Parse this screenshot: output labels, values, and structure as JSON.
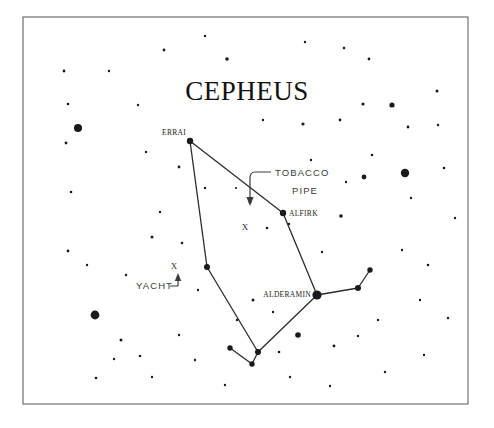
{
  "chart_data": {
    "type": "scatter",
    "title": "CEPHEUS",
    "subtitle": "",
    "xlabel": "",
    "ylabel": "",
    "grid": false,
    "legend_position": "none",
    "xlim": [
      23,
      468
    ],
    "ylim": [
      17,
      404
    ],
    "named_stars": [
      {
        "name": "ERRAI",
        "x": 190,
        "y": 141,
        "size": 3.2,
        "label_dx": -28,
        "label_dy": -6,
        "anchor": "start"
      },
      {
        "name": "ALFIRK",
        "x": 283,
        "y": 213,
        "size": 3.2,
        "label_dx": 6,
        "label_dy": 2.5,
        "anchor": "start"
      },
      {
        "name": "ALDERAMIN",
        "x": 317,
        "y": 295,
        "size": 4.6,
        "label_dx": -6,
        "label_dy": 1.5,
        "anchor": "end"
      }
    ],
    "figure_stars": [
      {
        "x": 190,
        "y": 141,
        "size": 3.2
      },
      {
        "x": 283,
        "y": 213,
        "size": 3.2
      },
      {
        "x": 317,
        "y": 295,
        "size": 4.6
      },
      {
        "x": 207,
        "y": 267,
        "size": 3.0
      },
      {
        "x": 258,
        "y": 352,
        "size": 3.0
      },
      {
        "x": 252,
        "y": 364,
        "size": 2.7
      },
      {
        "x": 230,
        "y": 348,
        "size": 2.7
      },
      {
        "x": 358,
        "y": 288,
        "size": 3.0
      },
      {
        "x": 370,
        "y": 270,
        "size": 2.7
      }
    ],
    "figure_lines": [
      {
        "x1": 190,
        "y1": 141,
        "x2": 207,
        "y2": 267
      },
      {
        "x1": 190,
        "y1": 141,
        "x2": 283,
        "y2": 213
      },
      {
        "x1": 283,
        "y1": 213,
        "x2": 317,
        "y2": 295
      },
      {
        "x1": 207,
        "y1": 267,
        "x2": 258,
        "y2": 352
      },
      {
        "x1": 317,
        "y1": 295,
        "x2": 258,
        "y2": 352
      },
      {
        "x1": 258,
        "y1": 352,
        "x2": 252,
        "y2": 364
      },
      {
        "x1": 252,
        "y1": 364,
        "x2": 230,
        "y2": 348
      },
      {
        "x1": 317,
        "y1": 295,
        "x2": 358,
        "y2": 288
      },
      {
        "x1": 358,
        "y1": 288,
        "x2": 370,
        "y2": 270
      }
    ],
    "asterisms": [
      {
        "name": "TOBACCO PIPE",
        "line1": "TOBACCO",
        "line2": "PIPE",
        "label_x": 275,
        "label_y1": 176,
        "label_y2": 194,
        "marker": "X",
        "marker_x": 245,
        "marker_y": 230,
        "leader": "M271,172 L255,172 Q250,172 250,178 L250,198",
        "arrow_x": 250,
        "arrow_y": 206,
        "arrow_dir": "down"
      },
      {
        "name": "YACHT",
        "line1": "YACHT",
        "line2": "",
        "label_x": 136,
        "label_y1": 289,
        "label_y2": 0,
        "marker": "X",
        "marker_x": 174,
        "marker_y": 269,
        "leader": "M170,286 L178,286 L178,280",
        "arrow_x": 178,
        "arrow_y": 273,
        "arrow_dir": "up"
      }
    ],
    "background_stars": [
      {
        "x": 78,
        "y": 128,
        "size": 4.0
      },
      {
        "x": 95,
        "y": 315,
        "size": 4.4
      },
      {
        "x": 405,
        "y": 173,
        "size": 4.2
      },
      {
        "x": 392,
        "y": 105,
        "size": 2.6
      },
      {
        "x": 364,
        "y": 177,
        "size": 2.4
      },
      {
        "x": 363,
        "y": 104,
        "size": 1.6
      },
      {
        "x": 340,
        "y": 120,
        "size": 1.4
      },
      {
        "x": 341,
        "y": 216,
        "size": 1.8
      },
      {
        "x": 346,
        "y": 182,
        "size": 1.2
      },
      {
        "x": 372,
        "y": 155,
        "size": 1.3
      },
      {
        "x": 411,
        "y": 198,
        "size": 1.2
      },
      {
        "x": 408,
        "y": 127,
        "size": 1.4
      },
      {
        "x": 437,
        "y": 91,
        "size": 1.5
      },
      {
        "x": 438,
        "y": 125,
        "size": 1.2
      },
      {
        "x": 369,
        "y": 59,
        "size": 1.4
      },
      {
        "x": 344,
        "y": 48,
        "size": 1.3
      },
      {
        "x": 305,
        "y": 42,
        "size": 1.2
      },
      {
        "x": 303,
        "y": 124,
        "size": 1.6
      },
      {
        "x": 263,
        "y": 120,
        "size": 1.2
      },
      {
        "x": 227,
        "y": 59,
        "size": 1.8
      },
      {
        "x": 205,
        "y": 36,
        "size": 1.2
      },
      {
        "x": 164,
        "y": 50,
        "size": 1.4
      },
      {
        "x": 109,
        "y": 71,
        "size": 1.2
      },
      {
        "x": 64,
        "y": 71,
        "size": 1.4
      },
      {
        "x": 68,
        "y": 104,
        "size": 1.3
      },
      {
        "x": 66,
        "y": 143,
        "size": 1.4
      },
      {
        "x": 138,
        "y": 105,
        "size": 1.2
      },
      {
        "x": 146,
        "y": 152,
        "size": 1.2
      },
      {
        "x": 179,
        "y": 167,
        "size": 1.4
      },
      {
        "x": 205,
        "y": 188,
        "size": 1.2
      },
      {
        "x": 250,
        "y": 202,
        "size": 1.5
      },
      {
        "x": 236,
        "y": 188,
        "size": 1.1
      },
      {
        "x": 267,
        "y": 228,
        "size": 1.3
      },
      {
        "x": 289,
        "y": 224,
        "size": 1.2
      },
      {
        "x": 71,
        "y": 192,
        "size": 1.3
      },
      {
        "x": 68,
        "y": 251,
        "size": 1.4
      },
      {
        "x": 87,
        "y": 265,
        "size": 1.2
      },
      {
        "x": 152,
        "y": 237,
        "size": 1.5
      },
      {
        "x": 182,
        "y": 243,
        "size": 1.3
      },
      {
        "x": 198,
        "y": 290,
        "size": 1.2
      },
      {
        "x": 126,
        "y": 275,
        "size": 1.2
      },
      {
        "x": 253,
        "y": 300,
        "size": 1.5
      },
      {
        "x": 273,
        "y": 312,
        "size": 1.2
      },
      {
        "x": 237,
        "y": 320,
        "size": 1.2
      },
      {
        "x": 298,
        "y": 335,
        "size": 2.8
      },
      {
        "x": 279,
        "y": 352,
        "size": 1.3
      },
      {
        "x": 334,
        "y": 346,
        "size": 1.4
      },
      {
        "x": 358,
        "y": 336,
        "size": 1.2
      },
      {
        "x": 378,
        "y": 320,
        "size": 1.2
      },
      {
        "x": 420,
        "y": 300,
        "size": 1.2
      },
      {
        "x": 428,
        "y": 265,
        "size": 1.3
      },
      {
        "x": 402,
        "y": 250,
        "size": 1.2
      },
      {
        "x": 121,
        "y": 340,
        "size": 1.5
      },
      {
        "x": 140,
        "y": 356,
        "size": 1.3
      },
      {
        "x": 114,
        "y": 359,
        "size": 1.2
      },
      {
        "x": 179,
        "y": 335,
        "size": 1.2
      },
      {
        "x": 195,
        "y": 360,
        "size": 1.2
      },
      {
        "x": 152,
        "y": 377,
        "size": 1.2
      },
      {
        "x": 96,
        "y": 378,
        "size": 1.3
      },
      {
        "x": 225,
        "y": 385,
        "size": 1.2
      },
      {
        "x": 290,
        "y": 377,
        "size": 1.2
      },
      {
        "x": 330,
        "y": 386,
        "size": 1.2
      },
      {
        "x": 385,
        "y": 372,
        "size": 1.2
      },
      {
        "x": 424,
        "y": 355,
        "size": 1.2
      },
      {
        "x": 448,
        "y": 318,
        "size": 1.2
      },
      {
        "x": 455,
        "y": 218,
        "size": 1.2
      },
      {
        "x": 444,
        "y": 168,
        "size": 1.3
      },
      {
        "x": 322,
        "y": 252,
        "size": 1.2
      },
      {
        "x": 311,
        "y": 160,
        "size": 1.2
      },
      {
        "x": 160,
        "y": 212,
        "size": 1.2
      }
    ]
  },
  "frame": {
    "x": 23,
    "y": 17,
    "width": 445,
    "height": 387,
    "border_color": "#555555",
    "background_color": "#ffffff"
  },
  "colors": {
    "star": "#1a1a1a",
    "line": "#2b2b2b",
    "annotation": "#3a3a3a",
    "title": "#111111"
  }
}
